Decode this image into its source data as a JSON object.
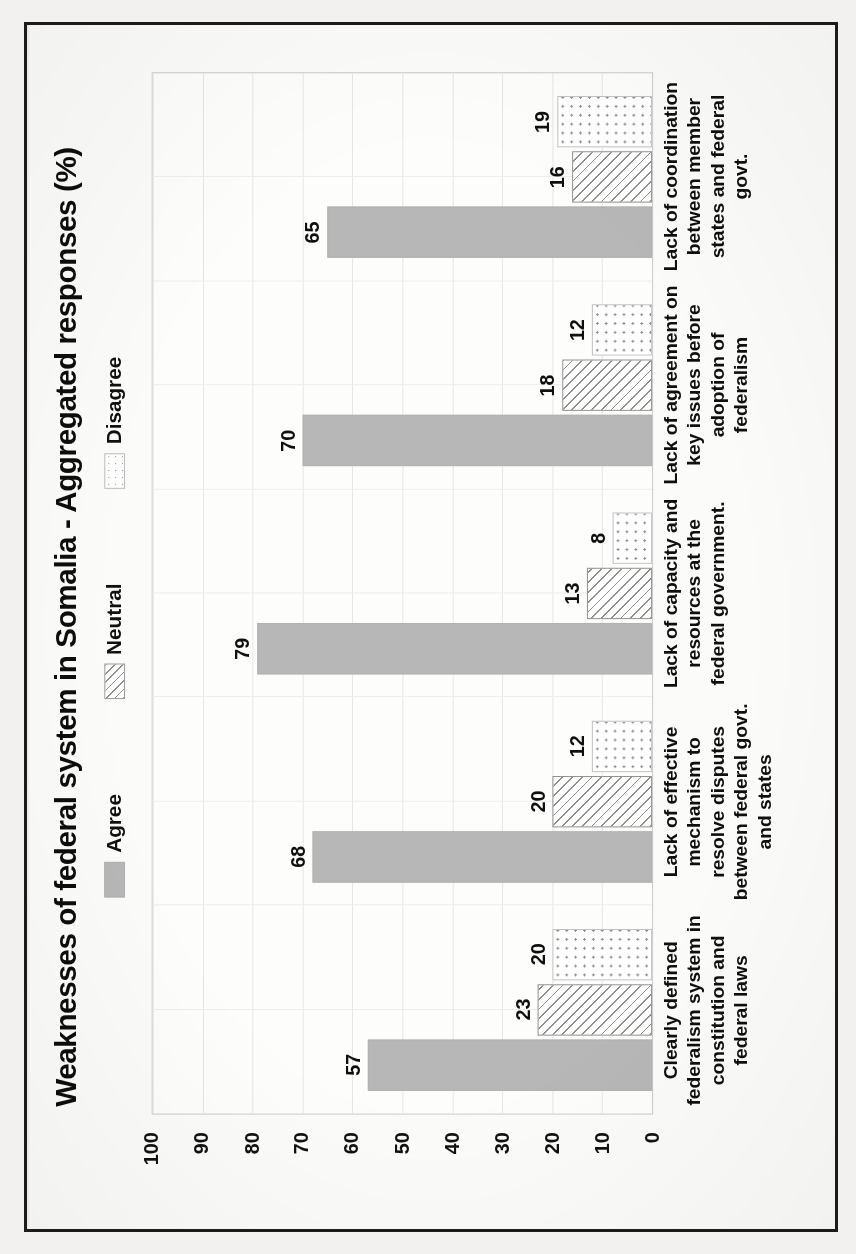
{
  "chart_data": {
    "type": "bar",
    "title": "Weaknesses of federal system in Somalia - Aggregated  responses (%)",
    "xlabel": "",
    "ylabel": "",
    "ylim": [
      0,
      100
    ],
    "ytick_step": 10,
    "yticks": [
      "100",
      "90",
      "80",
      "70",
      "60",
      "50",
      "40",
      "30",
      "20",
      "10",
      "0"
    ],
    "grid": true,
    "legend_position": "top-center",
    "orientation": "rotated-90-ccw",
    "categories": [
      "Clearly defined federalism system in constitution and federal laws",
      "Lack of effective mechanism to resolve disputes between federal govt. and states",
      "Lack of capacity and resources at the federal government.",
      "Lack of agreement on key issues before adoption of federalism",
      "Lack of coordination between member states and federal govt."
    ],
    "series": [
      {
        "name": "Agree",
        "pattern": "solid-gray",
        "color": "#b7b7b7",
        "values": [
          57,
          68,
          79,
          70,
          65
        ]
      },
      {
        "name": "Neutral",
        "pattern": "diagonal-hatch",
        "color": "#ffffff",
        "values": [
          23,
          20,
          13,
          18,
          16
        ]
      },
      {
        "name": "Disagree",
        "pattern": "dotted",
        "color": "#ffffff",
        "values": [
          20,
          12,
          8,
          12,
          19
        ]
      }
    ]
  },
  "legend": {
    "items": [
      {
        "label": "Agree"
      },
      {
        "label": "Neutral"
      },
      {
        "label": "Disagree"
      }
    ]
  }
}
